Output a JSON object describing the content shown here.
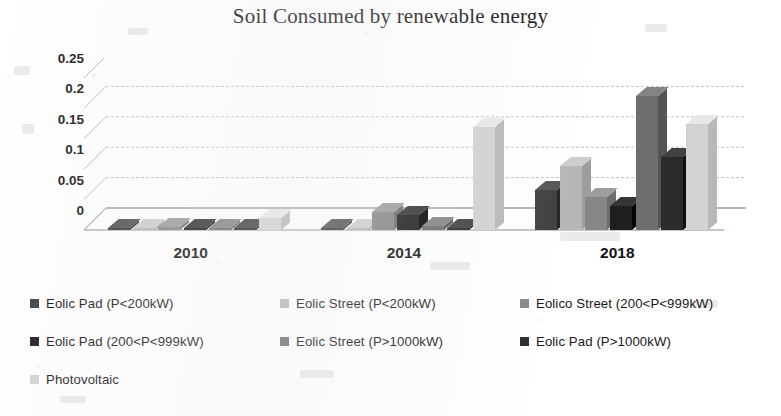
{
  "chart_data": {
    "type": "bar",
    "title": "Soil Consumed by renewable energy",
    "subtitle": "",
    "xlabel": "",
    "ylabel": "",
    "categories": [
      "2010",
      "2014",
      "2018"
    ],
    "ylim": [
      0,
      0.25
    ],
    "yticks": [
      "0",
      "0.05",
      "0.1",
      "0.15",
      "0.2",
      "0.25"
    ],
    "ytick_values": [
      0,
      0.05,
      0.1,
      0.15,
      0.2,
      0.25
    ],
    "grid": true,
    "legend_position": "bottom",
    "style": "3d-column",
    "series": [
      {
        "name": "Eolic Pad (P<200kW)",
        "color": "#3f3f3f",
        "values": [
          0.004,
          0.004,
          0.065
        ]
      },
      {
        "name": "Eolic Street  (P<200kW)",
        "color": "#b7b7b7",
        "values": [
          0.003,
          0.004,
          0.105
        ]
      },
      {
        "name": "Eolico Street (200<P<999kW)",
        "color": "#878787",
        "values": [
          0.005,
          0.03,
          0.055
        ]
      },
      {
        "name": "Eolic Pad (200<P<999kW)",
        "color": "#1f1f1f",
        "values": [
          0.004,
          0.025,
          0.04
        ]
      },
      {
        "name": "Eolic Street (P>1000kW)",
        "color": "#6e6e6e",
        "values": [
          0.003,
          0.006,
          0.22
        ]
      },
      {
        "name": "Eolic Pad (P>1000kW)",
        "color": "#2b2b2b",
        "values": [
          0.003,
          0.004,
          0.12
        ]
      },
      {
        "name": "Photovoltaic",
        "color": "#d2d2d2",
        "values": [
          0.02,
          0.17,
          0.175
        ]
      }
    ]
  },
  "legend": {
    "rows": [
      [
        {
          "label": "Eolic Pad (P<200kW)",
          "color": "#3f3f3f"
        },
        {
          "label": "Eolic Street  (P<200kW)",
          "color": "#b7b7b7"
        },
        {
          "label": "Eolico Street (200<P<999kW)",
          "color": "#878787"
        }
      ],
      [
        {
          "label": "Eolic Pad (200<P<999kW)",
          "color": "#1f1f1f"
        },
        {
          "label": "Eolic Street (P>1000kW)",
          "color": "#6e6e6e"
        },
        {
          "label": "Eolic Pad (P>1000kW)",
          "color": "#2b2b2b"
        }
      ],
      [
        {
          "label": "Photovoltaic",
          "color": "#d2d2d2"
        }
      ]
    ]
  }
}
